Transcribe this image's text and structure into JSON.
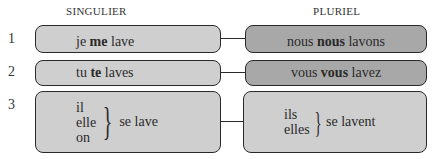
{
  "headers": {
    "singular": "SINGULIER",
    "plural": "PLURIEL"
  },
  "rows": [
    {
      "number": "1",
      "singular": {
        "subject": "je",
        "pronoun": "me",
        "verb": "lave"
      },
      "plural": {
        "subject": "nous",
        "pronoun": "nous",
        "verb": "lavons"
      }
    },
    {
      "number": "2",
      "singular": {
        "subject": "tu",
        "pronoun": "te",
        "verb": "laves"
      },
      "plural": {
        "subject": "vous",
        "pronoun": "vous",
        "verb": "lavez"
      }
    },
    {
      "number": "3",
      "singular": {
        "subjects": [
          "il",
          "elle",
          "on"
        ],
        "brace": "}",
        "verb_phrase": "se lave"
      },
      "plural": {
        "subjects": [
          "ils",
          "elles"
        ],
        "brace": "}",
        "verb_phrase": "se lavent"
      }
    }
  ],
  "colors": {
    "box_light": "#cfcfcf",
    "box_dark": "#a8a8a8",
    "border": "#2a2a2a"
  }
}
